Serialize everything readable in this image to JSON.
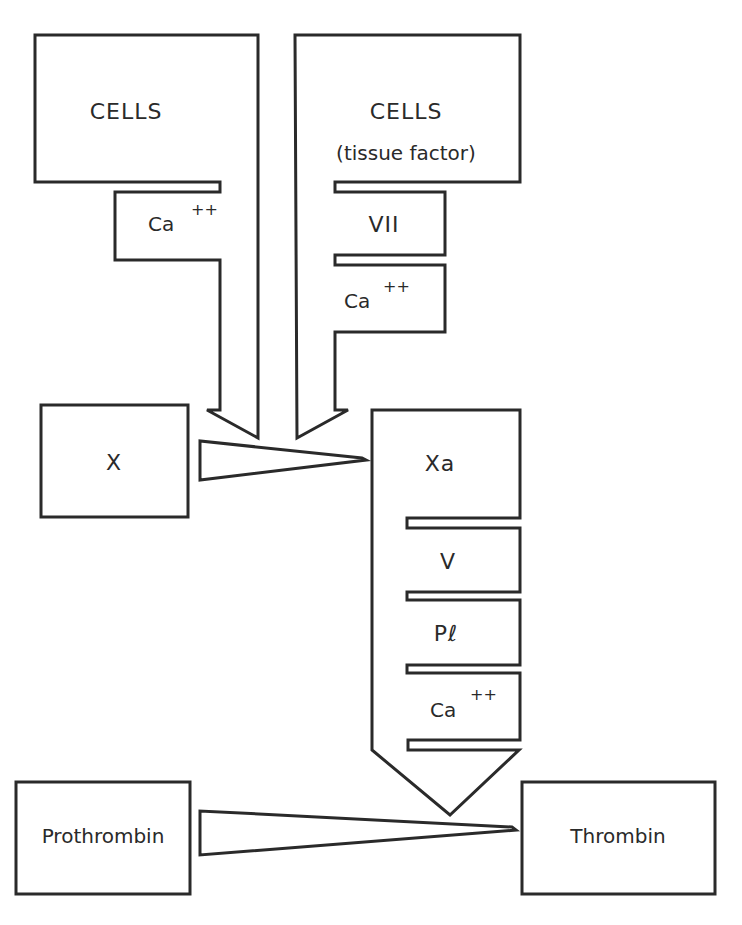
{
  "diagram": {
    "nodes": {
      "cells_left": {
        "label": "CELLS"
      },
      "cells_right": {
        "label": "CELLS",
        "sublabel": "(tissue factor)"
      },
      "left_cofactor": {
        "label": "Ca",
        "superscript": "++"
      },
      "right_cofactor_1": {
        "label": "VII"
      },
      "right_cofactor_2": {
        "label": "Ca",
        "superscript": "++"
      },
      "factor_x": {
        "label": "X"
      },
      "factor_xa": {
        "label": "Xa"
      },
      "xa_cofactor_1": {
        "label": "V"
      },
      "xa_cofactor_2": {
        "label": "Pℓ"
      },
      "xa_cofactor_3": {
        "label": "Ca",
        "superscript": "++"
      },
      "prothrombin": {
        "label": "Prothrombin"
      },
      "thrombin": {
        "label": "Thrombin"
      }
    },
    "edges": [
      {
        "from": "cells_left",
        "to": "factor_x_conversion",
        "type": "down-arrow"
      },
      {
        "from": "cells_right",
        "to": "factor_x_conversion",
        "type": "down-arrow"
      },
      {
        "from": "factor_x",
        "to": "factor_xa",
        "type": "wedge"
      },
      {
        "from": "factor_xa",
        "to": "prothrombin_conversion",
        "type": "down-arrow"
      },
      {
        "from": "prothrombin",
        "to": "thrombin",
        "type": "wedge"
      }
    ],
    "colors": {
      "stroke": "#2a2a2a",
      "background": "#ffffff"
    }
  }
}
